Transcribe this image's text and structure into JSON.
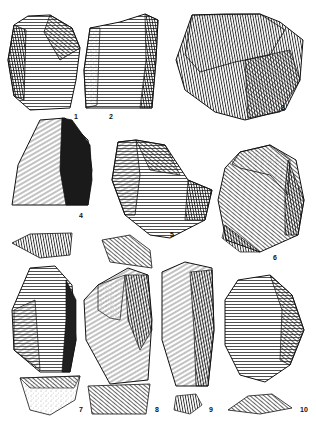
{
  "plate": {
    "type": "archaeological illustration plate",
    "subject": "stone tools (lithic artifacts)",
    "background": "#ffffff",
    "ink": "#111111"
  },
  "figures": [
    {
      "id": "1",
      "label": "1",
      "label_pos": [
        75,
        117
      ],
      "description": "flake core with dark facets"
    },
    {
      "id": "2",
      "label": "2",
      "label_pos": [
        110,
        117
      ],
      "description": "blade core fragment with longitudinal scars"
    },
    {
      "id": "3",
      "label": "3",
      "label_pos": [
        282,
        108
      ],
      "description": "nodule with stippled cortex"
    },
    {
      "id": "4",
      "label": "4",
      "label_pos": [
        80,
        216
      ],
      "description": "flake with dark dorsal face"
    },
    {
      "id": "5",
      "label": "5",
      "label_pos": [
        171,
        235
      ],
      "description": "flake with hatched ventral and retouch"
    },
    {
      "id": "6",
      "label": "6",
      "label_pos": [
        274,
        258
      ],
      "description": "scraper with cortex top"
    },
    {
      "id": "7",
      "label": "7",
      "label_pos": [
        80,
        410
      ],
      "description": "blade with cross-section below"
    },
    {
      "id": "8",
      "label": "8",
      "label_pos": [
        156,
        410
      ],
      "description": "blade with cortex and cross-section"
    },
    {
      "id": "9",
      "label": "9",
      "label_pos": [
        210,
        410
      ],
      "description": "long blade with small cross-section"
    },
    {
      "id": "10",
      "label": "10",
      "label_pos": [
        303,
        410
      ],
      "description": "retouched tool with lens-shaped section"
    }
  ]
}
